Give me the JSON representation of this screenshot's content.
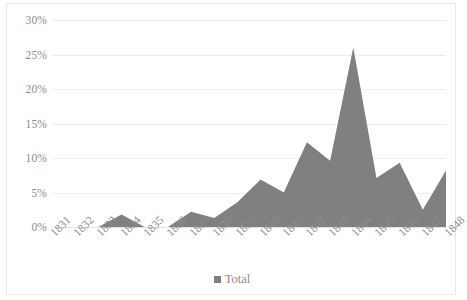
{
  "chart_data": {
    "type": "area",
    "title": "",
    "xlabel": "",
    "ylabel": "",
    "categories": [
      "1831",
      "1832",
      "1833",
      "1834",
      "1835",
      "1836",
      "1837",
      "1838",
      "1839",
      "1840",
      "1841",
      "1842",
      "1843",
      "1844",
      "1845",
      "1846",
      "1847",
      "1848"
    ],
    "series": [
      {
        "name": "Total",
        "color": "#808080",
        "values": [
          0,
          0,
          0,
          1.8,
          0,
          0,
          2.2,
          1.3,
          3.6,
          6.9,
          5.0,
          12.3,
          9.6,
          26.0,
          7.1,
          9.3,
          2.5,
          8.2
        ]
      }
    ],
    "ylim": [
      0,
      30
    ],
    "ytick_values": [
      0,
      5,
      10,
      15,
      20,
      25,
      30
    ],
    "ytick_labels": [
      "0%",
      "5%",
      "10%",
      "15%",
      "20%",
      "25%",
      "30%"
    ],
    "grid": true,
    "legend_position": "bottom",
    "legend_entries": [
      "Total"
    ]
  },
  "style": {
    "series_color": "#808080",
    "grid_color": "#eceded",
    "axis_text_color": "#8c8c8c",
    "border_color": "#e8e8e8",
    "background": "#ffffff"
  }
}
